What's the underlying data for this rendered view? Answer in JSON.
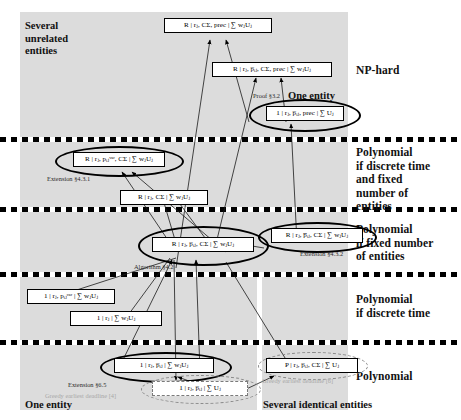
{
  "figure": {
    "type": "complexity-hierarchy-diagram",
    "width": 461,
    "height": 420,
    "background": "#ffffff",
    "panel_color": "#dcdcdc"
  },
  "band_labels": [
    {
      "id": "np-hard",
      "text": "NP-hard"
    },
    {
      "id": "poly-discrete-fixed",
      "text": "Polynomial\nif discrete time\nand fixed\nnumber of\nentities"
    },
    {
      "id": "poly-fixed",
      "text": "Polynomial\nif fixed number\nof entities"
    },
    {
      "id": "poly-discrete",
      "text": "Polynomial\nif discrete time"
    },
    {
      "id": "poly",
      "text": "Polynomial"
    }
  ],
  "band_labels_flat": {
    "np_hard": "NP-hard",
    "poly_discrete_fixed_l1": "Polynomial",
    "poly_discrete_fixed_l2": "if discrete time",
    "poly_discrete_fixed_l3": "and fixed",
    "poly_discrete_fixed_l4": "number of",
    "poly_discrete_fixed_l5": "entities",
    "poly_fixed_l1": "Polynomial",
    "poly_fixed_l2": "if fixed number",
    "poly_fixed_l3": "of entities",
    "poly_discrete_l1": "Polynomial",
    "poly_discrete_l2": "if discrete time",
    "poly_l1": "Polynomial"
  },
  "corner_labels": {
    "top_left_l1": "Several",
    "top_left_l2": "unrelated",
    "top_left_l3": "entities",
    "one_entity_top": "One entity",
    "bottom_left": "One entity",
    "bottom_right": "Several identical entities"
  },
  "nodes": [
    {
      "id": "n1",
      "label": "R | rⱼ, CΣ, prec | ∑ wⱼUⱼ",
      "band": "np-hard",
      "column": "unrelated"
    },
    {
      "id": "n2",
      "label": "R | rⱼ, p̅ᵢⱼ, CΣ, prec | ∑ wⱼUⱼ",
      "band": "np-hard",
      "column": "unrelated"
    },
    {
      "id": "n3",
      "label": "1 | rⱼ, p̅ᵢⱼ, prec | ∑ Uⱼ",
      "band": "np-hard",
      "column": "one-entity"
    },
    {
      "id": "n4",
      "label": "R | rⱼ, pᵢⱼᵛᵃʳ, CΣ | ∑ wⱼUⱼ",
      "band": "poly-discrete-fixed",
      "column": "unrelated"
    },
    {
      "id": "n5",
      "label": "R | rⱼ, CΣ | ∑ wⱼUⱼ",
      "band": "poly-discrete-fixed",
      "column": "unrelated"
    },
    {
      "id": "n6",
      "label": "R | rⱼ, p̅ᵢⱼ, CΣ | ∑ wⱼUⱼ",
      "band": "poly-fixed",
      "column": "unrelated"
    },
    {
      "id": "n7",
      "label": "R | rⱼ, p̅̅ᵢⱼ, CΣ | ∑ wⱼUⱼ",
      "band": "poly-fixed",
      "column": "identical"
    },
    {
      "id": "n8",
      "label": "1 | rⱼ, pᵢⱼᵛᵃʳ | ∑ wⱼUⱼ",
      "band": "poly-discrete",
      "column": "one-entity"
    },
    {
      "id": "n9",
      "label": "1 | rⱼ | ∑ wⱼUⱼ",
      "band": "poly-discrete",
      "column": "one-entity"
    },
    {
      "id": "n10",
      "label": "1 | rⱼ, p̅ᵢⱼ | ∑ wⱼUⱼ",
      "band": "poly",
      "column": "one-entity"
    },
    {
      "id": "n11",
      "label": "1 | rⱼ, p̅ᵢⱼ | ∑ Uⱼ",
      "band": "poly",
      "column": "one-entity"
    },
    {
      "id": "n12",
      "label": "P | rⱼ, p̅ᵢⱼ, CΣ | ∑ Uⱼ",
      "band": "poly",
      "column": "identical"
    }
  ],
  "annotations": [
    {
      "id": "a1",
      "text": "Proof §3.2",
      "style": "plain"
    },
    {
      "id": "a2",
      "text": "Extension §4.3.1",
      "style": "plain"
    },
    {
      "id": "a3",
      "text": "Algorithm §4.2",
      "style": "plain"
    },
    {
      "id": "a4",
      "text": "Extension §4.3.2",
      "style": "plain"
    },
    {
      "id": "a5",
      "text": "Extension §6.5",
      "style": "plain"
    },
    {
      "id": "a6",
      "text": "Greedy earliest deadline [4]",
      "style": "grey"
    },
    {
      "id": "a7",
      "text": "Greedy earliest deadline [6]",
      "style": "grey"
    }
  ],
  "separators_y": [
    137,
    207,
    272,
    340
  ]
}
